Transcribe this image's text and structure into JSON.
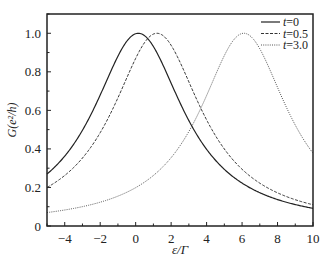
{
  "chart_data": {
    "type": "line",
    "title": "",
    "xlabel": "ε/Γ",
    "ylabel": "G(e²/h)",
    "xlim": [
      -5,
      10
    ],
    "ylim": [
      0,
      1.1
    ],
    "xticks": [
      -4,
      -2,
      0,
      2,
      4,
      6,
      8,
      10
    ],
    "yticks": [
      0,
      0.2,
      0.4,
      0.6,
      0.8,
      1.0
    ],
    "ytick_labels": [
      "0",
      "0.2",
      "0.4",
      "0.6",
      "0.8",
      "1.0"
    ],
    "grid": false,
    "legend_position": "upper right",
    "series": [
      {
        "name": "t=0",
        "style": "solid",
        "color": "#222222",
        "peak_x": 0.15,
        "peak_y": 1.0,
        "half_width": 3.13,
        "points": [
          [
            -5,
            0.27
          ],
          [
            -4,
            0.36
          ],
          [
            -2,
            0.68
          ],
          [
            0,
            1.0
          ],
          [
            2,
            0.74
          ],
          [
            4,
            0.4
          ],
          [
            6,
            0.22
          ],
          [
            8,
            0.14
          ],
          [
            10,
            0.09
          ]
        ]
      },
      {
        "name": "t=0.5",
        "style": "dashed",
        "color": "#333333",
        "peak_x": 1.2,
        "peak_y": 1.0,
        "half_width": 3.1,
        "points": [
          [
            -5,
            0.2
          ],
          [
            -4,
            0.26
          ],
          [
            -2,
            0.48
          ],
          [
            0,
            0.87
          ],
          [
            1.2,
            1.0
          ],
          [
            2,
            0.94
          ],
          [
            4,
            0.55
          ],
          [
            6,
            0.29
          ],
          [
            8,
            0.17
          ],
          [
            10,
            0.11
          ]
        ]
      },
      {
        "name": "t=3.0",
        "style": "dotted",
        "color": "#555555",
        "peak_x": 6.1,
        "peak_y": 1.0,
        "half_width": 3.04,
        "points": [
          [
            -5,
            0.07
          ],
          [
            -4,
            0.08
          ],
          [
            -2,
            0.12
          ],
          [
            0,
            0.2
          ],
          [
            2,
            0.35
          ],
          [
            4,
            0.68
          ],
          [
            6,
            1.0
          ],
          [
            8,
            0.72
          ],
          [
            10,
            0.38
          ]
        ]
      }
    ]
  },
  "axes": {
    "xlabel": "ε/Γ",
    "ylabel": "G(e²/h)"
  },
  "legend": [
    "t=0",
    "t=0.5",
    "t=3.0"
  ]
}
